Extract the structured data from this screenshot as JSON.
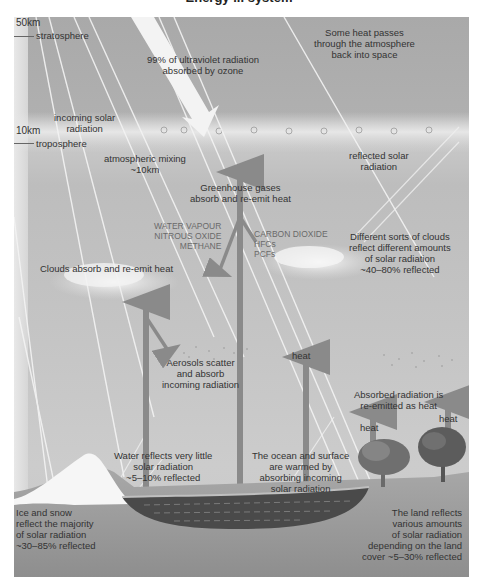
{
  "title": "Energy ... system",
  "altitude": {
    "top_km": "50km",
    "top_layer": "stratosphere",
    "mid_km": "10km",
    "mid_layer": "troposphere"
  },
  "labels": {
    "heat_to_space": [
      "Some heat passes",
      "through the atmosphere",
      "back into space"
    ],
    "uv": [
      "99% of ultraviolet radiation",
      "absorbed by ozone"
    ],
    "incoming_solar": [
      "incoming solar",
      "radiation"
    ],
    "mixing": [
      "atmospheric mixing",
      "~10km"
    ],
    "reflected_solar": [
      "reflected solar",
      "radiation"
    ],
    "greenhouse": [
      "Greenhouse gases",
      "absorb and re-emit heat"
    ],
    "gases_left": [
      "WATER VAPOUR",
      "NITROUS OXIDE",
      "METHANE"
    ],
    "gases_right": [
      "CARBON DIOXIDE",
      "HFCs",
      "PCFs"
    ],
    "clouds_reflect": [
      "Different sorts of clouds",
      "reflect different amounts",
      "of solar radiation",
      "~40–80% reflected"
    ],
    "clouds_absorb": "Clouds absorb and re-emit heat",
    "aerosols": [
      "Aerosols scatter",
      "and absorb",
      "incoming radiation"
    ],
    "heat_mid": "heat",
    "reemitted": [
      "Absorbed radiation is",
      "re-emitted as heat"
    ],
    "heat_left_tree": "heat",
    "heat_right_tree": "heat",
    "water": [
      "Water reflects very little",
      "solar radiation",
      "~5–10% reflected"
    ],
    "ocean": [
      "The ocean and surface",
      "are warmed by",
      "absorbing incoming",
      "solar radiation"
    ],
    "ice": [
      "Ice and snow",
      "reflect the majority",
      "of solar radiation",
      "~30–85% reflected"
    ],
    "land": [
      "The land reflects",
      "various amounts",
      "of solar radiation",
      "depending on the land",
      "cover ~5–30% reflected"
    ]
  },
  "colors": {
    "sky": "#b4b4b4",
    "arrow": "#8a8a8a",
    "beam": "#f2f2f2",
    "ocean": "#4a4a4a",
    "snow": "#f5f5f5",
    "ground": "#a0a0a0"
  }
}
